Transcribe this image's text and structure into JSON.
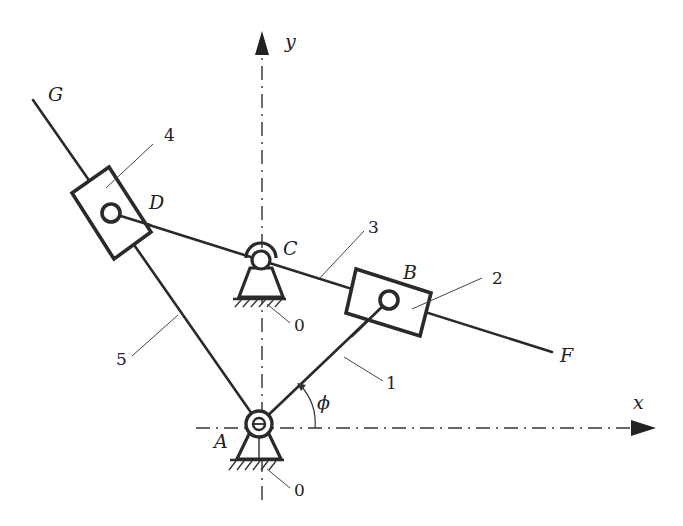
{
  "diagram": {
    "type": "planar linkage mechanism schematic",
    "axes": {
      "x_label": "x",
      "y_label": "y"
    },
    "angle_label": "ϕ",
    "points": {
      "A": "A",
      "B": "B",
      "C": "C",
      "D": "D",
      "F": "F",
      "G": "G"
    },
    "part_numbers": {
      "crank": "1",
      "slider_B": "2",
      "rocker_link": "3",
      "slider_D": "4",
      "guide_bar": "5",
      "ground_C": "0",
      "ground_A": "0"
    }
  }
}
